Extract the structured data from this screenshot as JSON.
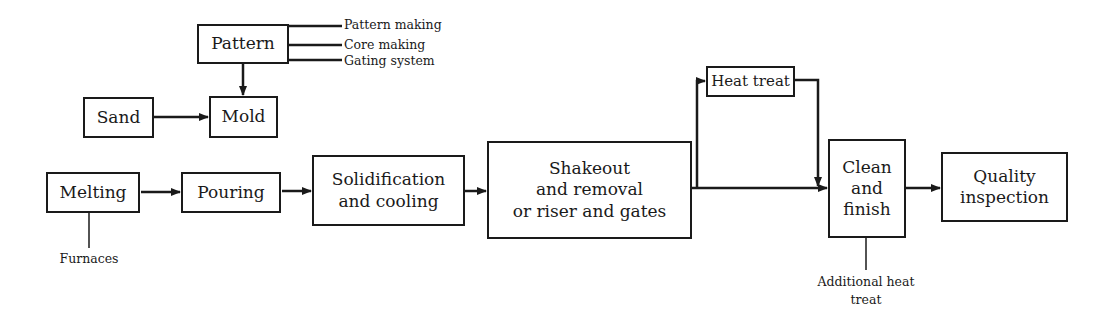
{
  "diagram": {
    "type": "process-flowchart",
    "nodes": {
      "pattern": {
        "label": "Pattern"
      },
      "sand": {
        "label": "Sand"
      },
      "mold": {
        "label": "Mold"
      },
      "melting": {
        "label": "Melting"
      },
      "pouring": {
        "label": "Pouring"
      },
      "solidification": {
        "label": "Solidification\nand cooling"
      },
      "shakeout": {
        "label": "Shakeout\nand removal\nor riser and gates"
      },
      "heat_treat": {
        "label": "Heat treat"
      },
      "clean": {
        "label": "Clean\nand\nfinish"
      },
      "quality": {
        "label": "Quality\ninspection"
      }
    },
    "annotations": {
      "pattern_subitems": [
        "Pattern making",
        "Core making",
        "Gating system"
      ],
      "melting_note": "Furnaces",
      "clean_note": "Additional heat\ntreat"
    },
    "edges": [
      {
        "from": "Pattern",
        "to": "Mold"
      },
      {
        "from": "Sand",
        "to": "Mold"
      },
      {
        "from": "Melting",
        "to": "Pouring"
      },
      {
        "from": "Pouring",
        "to": "Solidification and cooling"
      },
      {
        "from": "Solidification and cooling",
        "to": "Shakeout and removal or riser and gates"
      },
      {
        "from": "Shakeout and removal or riser and gates",
        "to": "Clean and finish"
      },
      {
        "from": "Shakeout and removal or riser and gates",
        "to": "Heat treat"
      },
      {
        "from": "Heat treat",
        "to": "Clean and finish"
      },
      {
        "from": "Clean and finish",
        "to": "Quality inspection"
      }
    ]
  }
}
